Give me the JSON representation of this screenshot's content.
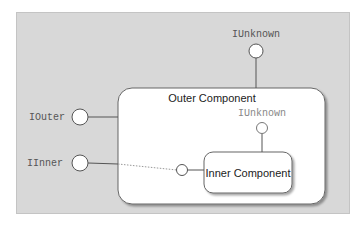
{
  "diagram": {
    "outer_component": {
      "label": "Outer Component"
    },
    "inner_component": {
      "label": "Inner Component"
    },
    "interfaces": {
      "outer_iunknown": {
        "label": "IUnknown"
      },
      "iouter": {
        "label": "IOuter"
      },
      "iinner": {
        "label": "IInner"
      },
      "inner_iunknown": {
        "label": "IUnknown"
      }
    },
    "colors": {
      "panel_background": "#d8d8d8",
      "component_fill": "#ffffff",
      "line": "#555555",
      "dotted_line": "#999999"
    }
  }
}
